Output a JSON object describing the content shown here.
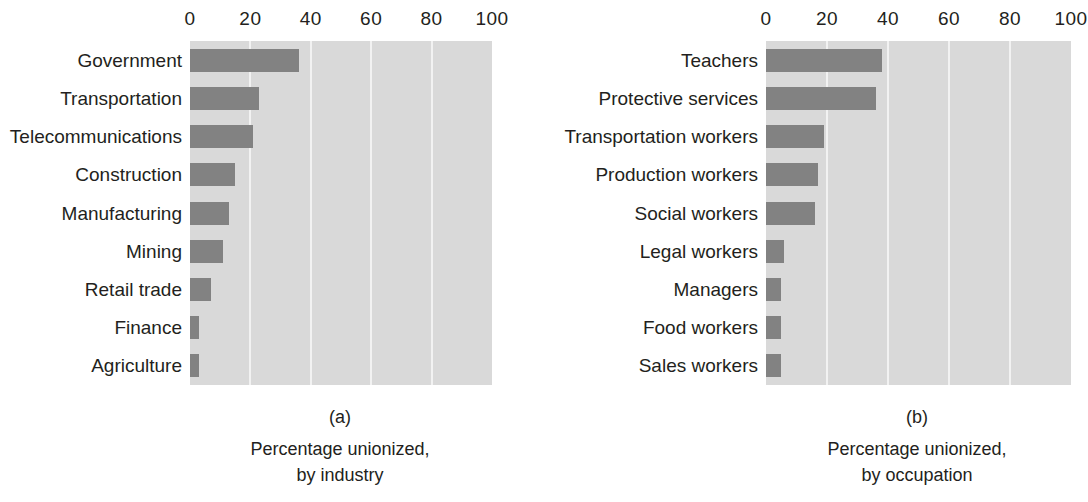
{
  "figure": {
    "background": "#ffffff",
    "bar_color": "#828282",
    "plot_background": "#d9d9d9",
    "gridline_color": "#f2f2f2",
    "text_color": "#231f20"
  },
  "chart_data": [
    {
      "type": "bar",
      "orientation": "horizontal",
      "panel_letter": "(a)",
      "title": "",
      "caption_line1": "Percentage unionized,",
      "caption_line2": "by industry",
      "xlabel": "",
      "ylabel": "",
      "xlim": [
        0,
        100
      ],
      "xticks": [
        0,
        20,
        40,
        60,
        80,
        100
      ],
      "xtick_labels": [
        "0",
        "20",
        "40",
        "60",
        "80",
        "100"
      ],
      "grid": true,
      "legend": "none",
      "categories": [
        "Government",
        "Transportation",
        "Telecommunications",
        "Construction",
        "Manufacturing",
        "Mining",
        "Retail trade",
        "Finance",
        "Agriculture"
      ],
      "values": [
        36,
        23,
        21,
        15,
        13,
        11,
        7,
        3,
        3
      ]
    },
    {
      "type": "bar",
      "orientation": "horizontal",
      "panel_letter": "(b)",
      "title": "",
      "caption_line1": "Percentage unionized,",
      "caption_line2": "by occupation",
      "xlabel": "",
      "ylabel": "",
      "xlim": [
        0,
        100
      ],
      "xticks": [
        0,
        20,
        40,
        60,
        80,
        100
      ],
      "xtick_labels": [
        "0",
        "20",
        "40",
        "60",
        "80",
        "100"
      ],
      "grid": true,
      "legend": "none",
      "categories": [
        "Teachers",
        "Protective services",
        "Transportation workers",
        "Production workers",
        "Social workers",
        "Legal workers",
        "Managers",
        "Food workers",
        "Sales workers"
      ],
      "values": [
        38,
        36,
        19,
        17,
        16,
        6,
        5,
        5,
        5
      ]
    }
  ]
}
